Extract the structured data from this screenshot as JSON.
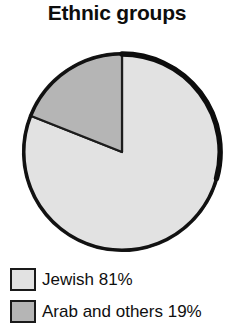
{
  "chart_data": {
    "type": "pie",
    "title": "Ethnic groups",
    "xlabel": "",
    "ylabel": "",
    "legend_position": "bottom-left",
    "grid": false,
    "categories": [
      "Jewish",
      "Arab and others"
    ],
    "values": [
      81,
      19
    ],
    "units": "percent",
    "start_angle_deg": 0,
    "direction": "clockwise",
    "slices": [
      {
        "label": "Jewish",
        "value": 81,
        "value_text": "81%",
        "legend_text": "Jewish 81%",
        "color": "#e2e2e2",
        "start_angle_deg": 68.4,
        "end_angle_deg": 360
      },
      {
        "label": "Arab and others",
        "value": 19,
        "value_text": "19%",
        "legend_text": "Arab and others 19%",
        "color": "#b5b5b5",
        "start_angle_deg": 0,
        "end_angle_deg": 68.4
      }
    ],
    "outline_color": "#111111",
    "background_color": "#ffffff"
  },
  "figure": {
    "title": "Ethnic groups"
  },
  "legend": {
    "items": [
      {
        "label": "Jewish 81%",
        "color": "#e2e2e2",
        "swatch_name": "legend-swatch-jewish"
      },
      {
        "label": "Arab and others 19%",
        "color": "#b5b5b5",
        "swatch_name": "legend-swatch-arab-and-others"
      }
    ]
  }
}
